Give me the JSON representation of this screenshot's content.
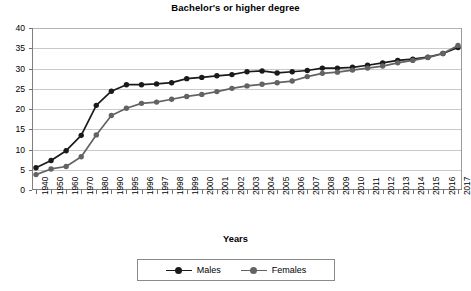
{
  "chart_data": {
    "type": "line",
    "title": "Bachelor's or higher degree",
    "xlabel": "Years",
    "ylabel": "",
    "ylim": [
      0,
      40
    ],
    "yticks": [
      0,
      5,
      10,
      15,
      20,
      25,
      30,
      35,
      40
    ],
    "grid": true,
    "legend_position": "bottom",
    "categories": [
      "1940",
      "1950",
      "1960",
      "1970",
      "1980",
      "1990",
      "1995",
      "1996",
      "1997",
      "1998",
      "1999",
      "2000",
      "2001",
      "2002",
      "2003",
      "2004",
      "2005",
      "2006",
      "2007",
      "2008",
      "2009",
      "2010",
      "2011",
      "2012",
      "2013",
      "2014",
      "2015",
      "2016",
      "2017"
    ],
    "series": [
      {
        "name": "Males",
        "color": "#1a1a1a",
        "values": [
          5.5,
          7.3,
          9.7,
          13.5,
          20.9,
          24.4,
          26.0,
          26.0,
          26.2,
          26.5,
          27.5,
          27.8,
          28.2,
          28.5,
          29.2,
          29.4,
          28.9,
          29.2,
          29.5,
          30.1,
          30.1,
          30.3,
          30.8,
          31.4,
          32.0,
          32.3,
          32.8,
          33.7,
          35.2
        ]
      },
      {
        "name": "Females",
        "color": "#636363",
        "values": [
          3.8,
          5.2,
          5.8,
          8.2,
          13.6,
          18.4,
          20.2,
          21.4,
          21.7,
          22.4,
          23.1,
          23.6,
          24.3,
          25.1,
          25.7,
          26.1,
          26.5,
          26.9,
          28.0,
          28.8,
          29.1,
          29.6,
          30.1,
          30.6,
          31.4,
          32.0,
          32.7,
          33.7,
          35.7
        ]
      }
    ]
  },
  "legend": {
    "items": [
      {
        "label": "Males"
      },
      {
        "label": "Females"
      }
    ]
  }
}
